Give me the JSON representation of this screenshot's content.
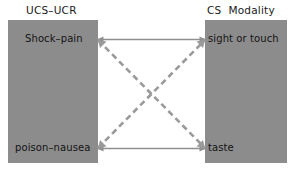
{
  "diagram": {
    "title_left": "UCS–UCR",
    "title_right": "CS  Modality",
    "nodes": {
      "top_left": "Shock–pain",
      "bottom_left": "poison–nausea",
      "top_right": "sight or touch",
      "bottom_right": "taste"
    },
    "colors": {
      "panel_fill": "#8c8c8c",
      "solid_link": "#8f8f8f",
      "dashed_link": "#9a9a9a",
      "text": "#141414",
      "background": "#ffffff"
    },
    "links": [
      {
        "id": "top-horizontal",
        "from": "Shock–pain",
        "to": "sight or touch",
        "style": "solid"
      },
      {
        "id": "bottom-horizontal",
        "from": "poison–nausea",
        "to": "taste",
        "style": "solid"
      },
      {
        "id": "diagonal-down-right",
        "from": "Shock–pain",
        "to": "taste",
        "style": "dashed"
      },
      {
        "id": "diagonal-up-right",
        "from": "poison–nausea",
        "to": "sight or touch",
        "style": "dashed"
      }
    ]
  }
}
